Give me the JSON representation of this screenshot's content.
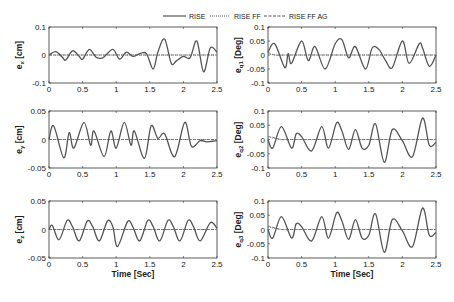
{
  "legend": {
    "entries": [
      {
        "label": "RISE",
        "style": "solid"
      },
      {
        "label": "RISE FF",
        "style": "dotted"
      },
      {
        "label": "RISE FF AG",
        "style": "dashed"
      }
    ]
  },
  "chart_data": [
    {
      "type": "line",
      "id": "ex",
      "ylabel": "e_x [cm]",
      "ylabel_main": "e",
      "ylabel_sub": "x",
      "ylabel_unit": "[cm]",
      "xlabel": "",
      "xlim": [
        0,
        2.5
      ],
      "ylim": [
        -0.1,
        0.1
      ],
      "xticks": [
        "0",
        "0.5",
        "1",
        "1.5",
        "2",
        "2.5"
      ],
      "yticks": [
        "0.1",
        "0",
        "-0.1"
      ],
      "x": [
        0,
        0.1,
        0.2,
        0.25,
        0.35,
        0.45,
        0.5,
        0.6,
        0.7,
        0.8,
        0.95,
        1.05,
        1.15,
        1.25,
        1.35,
        1.45,
        1.55,
        1.62,
        1.72,
        1.82,
        1.9,
        2.0,
        2.1,
        2.2,
        2.3,
        2.4,
        2.5
      ],
      "series": [
        {
          "name": "RISE",
          "values": [
            0,
            0.012,
            -0.008,
            -0.018,
            0.015,
            -0.005,
            -0.015,
            0.02,
            -0.008,
            -0.01,
            0.02,
            -0.015,
            0.01,
            -0.005,
            0.005,
            0.005,
            -0.05,
            0.01,
            0.057,
            -0.03,
            -0.02,
            -0.005,
            -0.01,
            0.05,
            -0.06,
            0.025,
            0.01
          ]
        },
        {
          "name": "RISE FF",
          "values": [
            0,
            0,
            0,
            0,
            0,
            0,
            0,
            0,
            0,
            0,
            0,
            0,
            0,
            0,
            0,
            0,
            0,
            0,
            0,
            0,
            0,
            0,
            0,
            0,
            0,
            0,
            0
          ]
        },
        {
          "name": "RISE FF AG",
          "values": [
            0,
            0,
            0,
            0,
            0,
            0,
            0,
            0,
            0,
            0,
            0,
            0,
            0,
            0,
            0,
            0,
            0,
            0,
            0,
            0,
            0,
            0,
            0,
            0,
            0,
            0,
            0
          ]
        }
      ]
    },
    {
      "type": "line",
      "id": "eq1",
      "ylabel": "e_q1 [Deg]",
      "ylabel_main": "e",
      "ylabel_sub": "q1",
      "ylabel_unit": "[Deg]",
      "xlabel": "",
      "xlim": [
        0,
        2.5
      ],
      "ylim": [
        -0.1,
        0.1
      ],
      "xticks": [
        "0",
        "0.5",
        "1",
        "1.5",
        "2",
        "2.5"
      ],
      "yticks": [
        "0.1",
        "0.05",
        "0",
        "-0.05",
        "-0.1"
      ],
      "x": [
        0,
        0.1,
        0.25,
        0.3,
        0.35,
        0.5,
        0.6,
        0.7,
        0.85,
        1.0,
        1.1,
        1.2,
        1.3,
        1.45,
        1.55,
        1.65,
        1.75,
        1.85,
        2.0,
        2.1,
        2.25,
        2.3,
        2.4,
        2.5
      ],
      "series": [
        {
          "name": "RISE",
          "values": [
            0.01,
            0.04,
            -0.045,
            0.005,
            -0.03,
            0.05,
            -0.02,
            0.03,
            -0.05,
            0.04,
            0.055,
            -0.01,
            0.03,
            -0.05,
            0.025,
            0.02,
            -0.02,
            -0.045,
            0.05,
            -0.03,
            0.04,
            0.025,
            -0.04,
            0
          ]
        },
        {
          "name": "RISE FF",
          "values": [
            0.005,
            0,
            0,
            0,
            0,
            0,
            0,
            0,
            0,
            0,
            0,
            0,
            0,
            0,
            0,
            0,
            0,
            0,
            0,
            0,
            0,
            0,
            0,
            0
          ]
        },
        {
          "name": "RISE FF AG",
          "values": [
            0.01,
            0,
            0,
            0,
            0,
            0,
            0,
            0,
            0,
            0,
            0,
            0,
            0,
            0,
            0,
            0,
            0,
            0,
            0,
            0,
            0,
            0,
            0,
            0
          ]
        }
      ]
    },
    {
      "type": "line",
      "id": "ey",
      "ylabel": "e_y [cm]",
      "ylabel_main": "e",
      "ylabel_sub": "y",
      "ylabel_unit": "[cm]",
      "xlabel": "",
      "xlim": [
        0,
        2.5
      ],
      "ylim": [
        -0.05,
        0.05
      ],
      "xticks": [
        "0",
        "0.5",
        "1",
        "1.5",
        "2",
        "2.5"
      ],
      "yticks": [
        "0.05",
        "0",
        "-0.05"
      ],
      "x": [
        0,
        0.07,
        0.22,
        0.3,
        0.37,
        0.52,
        0.62,
        0.67,
        0.82,
        0.92,
        1.0,
        1.12,
        1.22,
        1.27,
        1.42,
        1.52,
        1.62,
        1.72,
        1.87,
        2.02,
        2.12,
        2.25,
        2.35,
        2.5
      ],
      "series": [
        {
          "name": "RISE",
          "values": [
            0,
            0.024,
            -0.032,
            0.012,
            -0.015,
            0.03,
            -0.01,
            0.015,
            -0.03,
            0.015,
            -0.015,
            0.03,
            -0.01,
            0.015,
            -0.033,
            0.024,
            0.002,
            0.01,
            -0.03,
            0.03,
            -0.012,
            -0.002,
            -0.004,
            -0.002
          ]
        },
        {
          "name": "RISE FF",
          "values": [
            0,
            0,
            0,
            0,
            0,
            0,
            0,
            0,
            0,
            0,
            0,
            0,
            0,
            0,
            0,
            0,
            0,
            0,
            0,
            0,
            0,
            0,
            0,
            0
          ]
        },
        {
          "name": "RISE FF AG",
          "values": [
            0,
            0,
            0,
            0,
            0,
            0,
            0,
            0,
            0,
            0,
            0,
            0,
            0,
            0,
            0,
            0,
            0,
            0,
            0,
            0,
            0,
            0,
            0,
            0
          ]
        }
      ]
    },
    {
      "type": "line",
      "id": "eq2",
      "ylabel": "e_q2 [Deg]",
      "ylabel_main": "e",
      "ylabel_sub": "q2",
      "ylabel_unit": "[Deg]",
      "xlabel": "",
      "xlim": [
        0,
        2.5
      ],
      "ylim": [
        -0.1,
        0.1
      ],
      "xticks": [
        "0",
        "0.5",
        "1",
        "1.5",
        "2",
        "2.5"
      ],
      "yticks": [
        "0.1",
        "0.05",
        "0",
        "-0.05",
        "-0.1"
      ],
      "x": [
        0,
        0.07,
        0.2,
        0.35,
        0.42,
        0.5,
        0.65,
        0.8,
        0.9,
        1.02,
        1.1,
        1.2,
        1.3,
        1.4,
        1.5,
        1.6,
        1.73,
        1.85,
        2.0,
        2.15,
        2.3,
        2.4,
        2.5
      ],
      "series": [
        {
          "name": "RISE",
          "values": [
            0,
            -0.03,
            0.045,
            -0.03,
            0.02,
            0.01,
            -0.04,
            0.045,
            -0.03,
            0.058,
            0.03,
            -0.035,
            0.035,
            -0.03,
            -0.02,
            0.055,
            -0.08,
            0.035,
            -0.005,
            -0.06,
            0.075,
            -0.02,
            -0.01
          ]
        },
        {
          "name": "RISE FF",
          "values": [
            0.01,
            0.005,
            0,
            0,
            0,
            0,
            0,
            0,
            0,
            0,
            0,
            0,
            0,
            0,
            0,
            0,
            0,
            0,
            0,
            0,
            0,
            0,
            0
          ]
        },
        {
          "name": "RISE FF AG",
          "values": [
            0.01,
            0.008,
            0,
            0,
            0,
            0,
            0,
            0,
            0,
            0,
            0,
            0,
            0,
            0,
            0,
            0,
            0,
            0,
            0,
            0,
            0,
            0,
            0
          ]
        }
      ]
    },
    {
      "type": "line",
      "id": "ez",
      "ylabel": "e_z [cm]",
      "ylabel_main": "e",
      "ylabel_sub": "z",
      "ylabel_unit": "[cm]",
      "xlabel": "Time [Sec]",
      "xlim": [
        0,
        2.5
      ],
      "ylim": [
        -0.05,
        0.05
      ],
      "xticks": [
        "0",
        "0.5",
        "1",
        "1.5",
        "2",
        "2.5"
      ],
      "yticks": [
        "0.05",
        "0",
        "-0.05"
      ],
      "x": [
        0,
        0.05,
        0.15,
        0.27,
        0.35,
        0.45,
        0.57,
        0.65,
        0.75,
        0.87,
        0.95,
        1.02,
        1.17,
        1.25,
        1.35,
        1.47,
        1.55,
        1.65,
        1.77,
        1.85,
        1.95,
        2.07,
        2.15,
        2.25,
        2.4,
        2.5
      ],
      "series": [
        {
          "name": "RISE",
          "values": [
            0,
            0.007,
            -0.018,
            0.016,
            0.005,
            -0.02,
            0.015,
            0.005,
            -0.02,
            0.015,
            0.005,
            -0.03,
            0.014,
            0.004,
            -0.02,
            0.016,
            0.005,
            -0.02,
            0.016,
            0.005,
            -0.02,
            0.016,
            0.005,
            -0.02,
            0.012,
            0.002
          ]
        },
        {
          "name": "RISE FF",
          "values": [
            0,
            0,
            0,
            0,
            0,
            0,
            0,
            0,
            0,
            0,
            0,
            0,
            0,
            0,
            0,
            0,
            0,
            0,
            0,
            0,
            0,
            0,
            0,
            0,
            0,
            0
          ]
        },
        {
          "name": "RISE FF AG",
          "values": [
            0,
            0,
            0,
            0,
            0,
            0,
            0,
            0,
            0,
            0,
            0,
            0,
            0,
            0,
            0,
            0,
            0,
            0,
            0,
            0,
            0,
            0,
            0,
            0,
            0,
            0
          ]
        }
      ]
    },
    {
      "type": "line",
      "id": "eq3",
      "ylabel": "e_q3 [Deg]",
      "ylabel_main": "e",
      "ylabel_sub": "q3",
      "ylabel_unit": "[Deg]",
      "xlabel": "Time [Sec]",
      "xlim": [
        0,
        2.5
      ],
      "ylim": [
        -0.1,
        0.1
      ],
      "xticks": [
        "0",
        "0.5",
        "1",
        "1.5",
        "2",
        "2.5"
      ],
      "yticks": [
        "0.1",
        "0.05",
        "0",
        "-0.05",
        "-0.1"
      ],
      "x": [
        0,
        0.07,
        0.2,
        0.35,
        0.42,
        0.5,
        0.65,
        0.8,
        0.9,
        1.02,
        1.1,
        1.2,
        1.3,
        1.4,
        1.5,
        1.6,
        1.73,
        1.85,
        2.0,
        2.15,
        2.3,
        2.4,
        2.5
      ],
      "series": [
        {
          "name": "RISE",
          "values": [
            0,
            -0.03,
            0.045,
            -0.03,
            0.02,
            0.01,
            -0.04,
            0.045,
            -0.03,
            0.058,
            0.03,
            -0.035,
            0.035,
            -0.03,
            -0.02,
            0.055,
            -0.08,
            0.035,
            -0.005,
            -0.06,
            0.075,
            -0.02,
            -0.01
          ]
        },
        {
          "name": "RISE FF",
          "values": [
            0.01,
            0.005,
            0,
            0,
            0,
            0,
            0,
            0,
            0,
            0,
            0,
            0,
            0,
            0,
            0,
            0,
            0,
            0,
            0,
            0,
            0,
            0,
            0
          ]
        },
        {
          "name": "RISE FF AG",
          "values": [
            0.012,
            0.008,
            0,
            0,
            0,
            0,
            0,
            0,
            0,
            0,
            0,
            0,
            0,
            0,
            0,
            0,
            0,
            0,
            0,
            0,
            0,
            0,
            0
          ]
        }
      ]
    }
  ]
}
